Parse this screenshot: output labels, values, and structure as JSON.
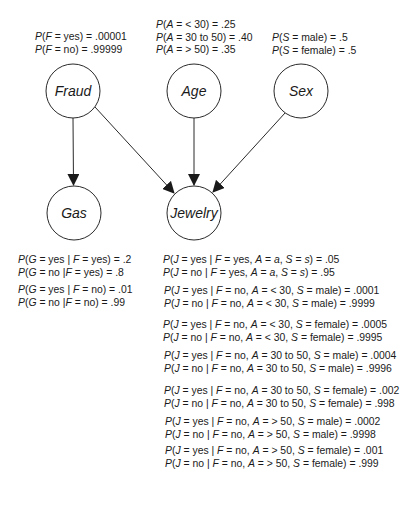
{
  "diagram": {
    "type": "bayesian-network",
    "nodes": [
      {
        "id": "fraud",
        "label": "Fraud",
        "cx": 73,
        "cy": 91
      },
      {
        "id": "age",
        "label": "Age",
        "cx": 194,
        "cy": 91
      },
      {
        "id": "sex",
        "label": "Sex",
        "cx": 301,
        "cy": 91
      },
      {
        "id": "gas",
        "label": "Gas",
        "cx": 74,
        "cy": 213
      },
      {
        "id": "jewelry",
        "label": "Jewelry",
        "cx": 194,
        "cy": 213
      }
    ],
    "edges": [
      {
        "from": "fraud",
        "to": "gas"
      },
      {
        "from": "fraud",
        "to": "jewelry"
      },
      {
        "from": "age",
        "to": "jewelry"
      },
      {
        "from": "sex",
        "to": "jewelry"
      }
    ]
  },
  "cpts": {
    "fraud": {
      "lines": [
        {
          "var": "F",
          "cond": "",
          "value": "yes",
          "prob": ".00001",
          "text": "P(F = yes) = .00001"
        },
        {
          "var": "F",
          "cond": "",
          "value": "no",
          "prob": ".99999",
          "text": "P(F = no) = .99999"
        }
      ]
    },
    "age": {
      "lines": [
        {
          "text": "P(A = < 30) = .25",
          "value": "< 30",
          "prob": ".25"
        },
        {
          "text": "P(A = 30 to 50) = .40",
          "value": "30 to 50",
          "prob": ".40"
        },
        {
          "text": "P(A = > 50) = .35",
          "value": "> 50",
          "prob": ".35"
        }
      ]
    },
    "sex": {
      "lines": [
        {
          "text": "P(S = male) = .5",
          "value": "male",
          "prob": ".5"
        },
        {
          "text": "P(S = female) = .5",
          "value": "female",
          "prob": ".5"
        }
      ]
    },
    "gas": {
      "groups": [
        {
          "lines": [
            {
              "text": "P(G = yes | F = yes) = .2",
              "g": "yes",
              "f": "yes",
              "prob": ".2"
            },
            {
              "text": "P(G = no |F = yes) = .8",
              "g": "no",
              "f": "yes",
              "prob": ".8"
            }
          ]
        },
        {
          "lines": [
            {
              "text": "P(G = yes | F = no) = .01",
              "g": "yes",
              "f": "no",
              "prob": ".01"
            },
            {
              "text": "P(G = no |F = no) = .99",
              "g": "no",
              "f": "no",
              "prob": ".99"
            }
          ]
        }
      ]
    },
    "jewelry": {
      "groups": [
        {
          "lines": [
            {
              "j": "yes",
              "f": "yes",
              "a": "a",
              "s": "s",
              "prob": ".05",
              "text": "P(J = yes | F = yes, A = a, S = s) = .05"
            },
            {
              "j": "no",
              "f": "yes",
              "a": "a",
              "s": "s",
              "prob": ".95",
              "text": "P(J = no | F = yes, A = a, S = s) = .95"
            }
          ]
        },
        {
          "lines": [
            {
              "j": "yes",
              "f": "no",
              "a": "< 30",
              "s": "male",
              "prob": ".0001",
              "text": "P(J = yes | F = no, A = < 30, S = male) = .0001"
            },
            {
              "j": "no",
              "f": "no",
              "a": "< 30",
              "s": "male",
              "prob": ".9999",
              "text": "P(J = no | F = no, A = < 30, S = male) = .9999"
            }
          ]
        },
        {
          "lines": [
            {
              "j": "yes",
              "f": "no",
              "a": "< 30",
              "s": "female",
              "prob": ".0005",
              "text": "P(J = yes | F = no, A = < 30, S = female) = .0005"
            },
            {
              "j": "no",
              "f": "no",
              "a": "< 30",
              "s": "female",
              "prob": ".9995",
              "text": "P(J = no | F = no, A = < 30, S = female) = .9995"
            }
          ]
        },
        {
          "lines": [
            {
              "j": "yes",
              "f": "no",
              "a": "30 to 50",
              "s": "male",
              "prob": ".0004",
              "text": "P(J = yes | F = no, A = 30 to 50, S = male) = .0004"
            },
            {
              "j": "no",
              "f": "no",
              "a": "30 to 50",
              "s": "male",
              "prob": ".9996",
              "text": "P(J = no | F = no, A =  30 to 50, S = male) = .9996"
            }
          ]
        },
        {
          "lines": [
            {
              "j": "yes",
              "f": "no",
              "a": "30 to 50",
              "s": "female",
              "prob": ".002",
              "text": "P(J = yes | F = no, A = 30 to 50, S = female) = .002"
            },
            {
              "j": "no",
              "f": "no",
              "a": "30 to 50",
              "s": "female",
              "prob": ".998",
              "text": "P(J = no | F = no, A =  30 to 50, S = female) = .998"
            }
          ]
        },
        {
          "lines": [
            {
              "j": "yes",
              "f": "no",
              "a": "> 50",
              "s": "male",
              "prob": ".0002",
              "text": "P(J = yes | F = no, A = > 50, S = male) = .0002"
            },
            {
              "j": "no",
              "f": "no",
              "a": "> 50",
              "s": "male",
              "prob": ".9998",
              "text": "P(J = no | F = no, A = > 50, S = male) = .9998"
            }
          ]
        },
        {
          "lines": [
            {
              "j": "yes",
              "f": "no",
              "a": "> 50",
              "s": "female",
              "prob": ".001",
              "text": "P(J = yes | F = no, A = > 50, S = female) = .001"
            },
            {
              "j": "no",
              "f": "no",
              "a": "> 50",
              "s": "female",
              "prob": ".999",
              "text": "P(J = no | F = no, A = > 50, S = female) = .999"
            }
          ]
        }
      ]
    }
  },
  "colors": {
    "stroke": "#2a2a2a",
    "text": "#1a1a1a",
    "background": "#ffffff"
  }
}
